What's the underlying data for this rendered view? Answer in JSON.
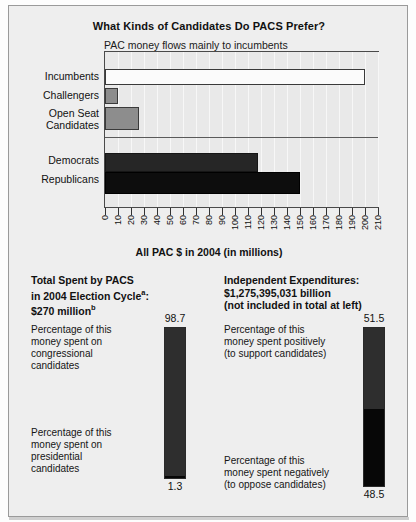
{
  "chart_data": {
    "type": "bar",
    "orientation": "horizontal",
    "title": "What Kinds of Candidates Do PACS Prefer?",
    "subtitle": "PAC money flows mainly to incumbents",
    "xlabel": "All PAC $ in 2004  (in millions)",
    "ylabel": "",
    "xlim": [
      0,
      210
    ],
    "xticks": [
      0,
      10,
      20,
      30,
      40,
      50,
      60,
      70,
      80,
      90,
      100,
      110,
      120,
      130,
      140,
      150,
      160,
      170,
      180,
      190,
      200,
      210
    ],
    "grid": true,
    "legend": "none",
    "groups": [
      {
        "name": "candidate-status",
        "categories": [
          "Incumbents",
          "Challengers",
          "Open Seat Candidates"
        ],
        "values": [
          200,
          10,
          26
        ],
        "colors": [
          "#fbfbfb",
          "#8d8d8d",
          "#8d8d8d"
        ]
      },
      {
        "name": "party",
        "categories": [
          "Democrats",
          "Republicans"
        ],
        "values": [
          118,
          150
        ],
        "colors": [
          "#262626",
          "#0d0d0d"
        ]
      }
    ],
    "categories": [
      "Incumbents",
      "Challengers",
      "Open Seat Candidates",
      "Democrats",
      "Republicans"
    ],
    "values": [
      200,
      10,
      26,
      118,
      150
    ]
  },
  "header": {
    "title": "What Kinds of Candidates Do PACS Prefer?",
    "subtitle": "PAC money flows mainly to incumbents"
  },
  "axis": {
    "x_title": "All PAC $ in 2004  (in millions)",
    "ticks": [
      "0",
      "10",
      "20",
      "30",
      "40",
      "50",
      "60",
      "70",
      "80",
      "90",
      "100",
      "110",
      "120",
      "130",
      "140",
      "150",
      "160",
      "170",
      "180",
      "190",
      "200",
      "210"
    ]
  },
  "bars": {
    "incumbents_label": "Incumbents",
    "challengers_label": "Challengers",
    "open_seat_label_1": "Open Seat",
    "open_seat_label_2": "Candidates",
    "democrats_label": "Democrats",
    "republicans_label": "Republicans"
  },
  "panels": {
    "left": {
      "title_line1": "Total Spent by PACS",
      "title_line2_pre": "in 2004 Election Cycle",
      "title_line2_sup": "a",
      "title_line2_post": ":",
      "title_line3_pre": "$270 million",
      "title_line3_sup": "b",
      "top_caption": "Percentage of this\nmoney spent on\ncongressional\ncandidates",
      "bottom_caption": "Percentage of this\nmoney spent on\npresidential\ncandidates",
      "top_value": "98.7",
      "bottom_value": "1.3",
      "gauge": {
        "type": "stacked-vertical",
        "top_percent": 98.7,
        "bottom_percent": 1.3,
        "top_color": "#2e2e2e",
        "bottom_color": "#070707"
      }
    },
    "right": {
      "title_line1": "Independent Expenditures:",
      "title_line2": "$1,275,395,031 billion",
      "title_line3": "(not included in total at left)",
      "top_caption": "Percentage of this\nmoney spent positively\n(to support candidates)",
      "bottom_caption": "Percentage of this\nmoney spent negatively\n(to oppose candidates)",
      "top_value": "51.5",
      "bottom_value": "48.5",
      "gauge": {
        "type": "stacked-vertical",
        "top_percent": 51.5,
        "bottom_percent": 48.5,
        "top_color": "#2e2e2e",
        "bottom_color": "#070707"
      }
    }
  },
  "colors": {
    "panel_bg": "#eeeeee",
    "plot_bg": "#e9e9e9",
    "frame": "#9a9a9a",
    "ink": "#111111"
  }
}
